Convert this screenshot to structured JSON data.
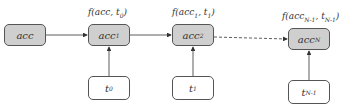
{
  "diagram": {
    "accumulators": [
      {
        "id": "acc",
        "base": "acc",
        "sub": ""
      },
      {
        "id": "acc1",
        "base": "acc",
        "sub": "1"
      },
      {
        "id": "acc2",
        "base": "acc",
        "sub": "2"
      },
      {
        "id": "accN",
        "base": "acc",
        "sub": "N"
      }
    ],
    "inputs": [
      {
        "id": "t0",
        "base": "t",
        "sub": "0"
      },
      {
        "id": "t1",
        "base": "t",
        "sub": "1"
      },
      {
        "id": "tN-1",
        "base": "t",
        "sub": "N-1"
      }
    ],
    "functions": [
      {
        "prefix": "f(acc, t",
        "sub": "0",
        "suffix": ")"
      },
      {
        "prefix": "f(acc",
        "sub1": "1",
        "mid": ", t",
        "sub": "1",
        "suffix": ")"
      },
      {
        "prefix": "f(acc",
        "sub1": "N-1",
        "mid": ", t",
        "sub": "N-1",
        "suffix": ")"
      }
    ],
    "colors": {
      "accumulator_fill": "#cfcfcf",
      "input_fill": "#ffffff",
      "stroke": "#555555"
    }
  }
}
